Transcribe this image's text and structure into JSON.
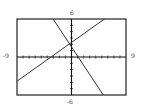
{
  "chart_data": {
    "type": "line",
    "title": "",
    "xlabel": "",
    "ylabel": "",
    "xlim": [
      -9,
      9
    ],
    "ylim": [
      -6,
      6
    ],
    "x_tick_step": 1,
    "y_tick_step": 1,
    "grid": false,
    "tick_labels": {
      "xmin": "-9",
      "xmax": "9",
      "ymax": "6",
      "ymin": "-6"
    },
    "series": [
      {
        "name": "line-rising",
        "x": [
          -9,
          5
        ],
        "y": [
          -3.5,
          6
        ],
        "slope": 0.68,
        "intercept": 2.3
      },
      {
        "name": "line-falling",
        "x": [
          -3,
          5.1
        ],
        "y": [
          6,
          -5.8
        ],
        "slope": -1.45,
        "intercept": 1.6
      }
    ],
    "intersection": {
      "x": 0.4,
      "y": 2.2
    }
  },
  "labels": {
    "xmin": "-9",
    "xmax": "9",
    "ymax": "6",
    "ymin": "-6"
  }
}
